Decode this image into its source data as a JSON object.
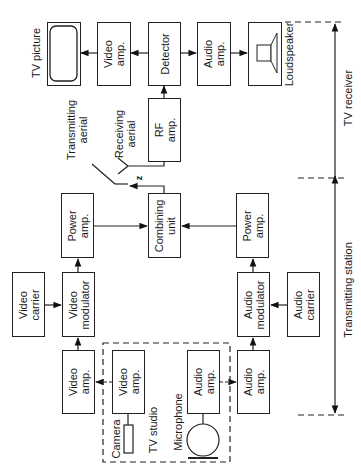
{
  "diagram": {
    "orientation": "rotated-90-ccw",
    "sections": {
      "receiver_label": "TV receiver",
      "transmitter_label": "Transmitting station",
      "studio_label": "TV studio"
    },
    "blocks": {
      "tv_picture": {
        "label": "TV picture"
      },
      "rx_video_amp": {
        "line1": "Video",
        "line2": "amp."
      },
      "detector": {
        "line1": "Detector"
      },
      "rx_audio_amp": {
        "line1": "Audio",
        "line2": "amp."
      },
      "loudspeaker": {
        "label": "Loudspeaker"
      },
      "rf_amp": {
        "line1": "RF",
        "line2": "amp."
      },
      "combining_unit": {
        "line1": "Combining",
        "line2": "unit"
      },
      "video_power_amp": {
        "line1": "Power",
        "line2": "amp."
      },
      "audio_power_amp": {
        "line1": "Power",
        "line2": "amp."
      },
      "video_carrier": {
        "line1": "Video",
        "line2": "carrier"
      },
      "video_modulator": {
        "line1": "Video",
        "line2": "modulator"
      },
      "audio_modulator": {
        "line1": "Audio",
        "line2": "modulator"
      },
      "audio_carrier": {
        "line1": "Audio",
        "line2": "carrier"
      },
      "tx_video_amp": {
        "line1": "Video",
        "line2": "amp."
      },
      "studio_video_amp": {
        "line1": "Video",
        "line2": "amp."
      },
      "studio_audio_amp": {
        "line1": "Audio",
        "line2": "amp."
      },
      "tx_audio_amp": {
        "line1": "Audio",
        "line2": "amp."
      }
    },
    "labels": {
      "camera": "Camera",
      "microphone": "Microphone",
      "transmitting_aerial_1": "Transmitting",
      "transmitting_aerial_2": "aerial",
      "receiving_aerial_1": "Receiving",
      "receiving_aerial_2": "aerial",
      "wave_symbol": "z"
    },
    "connections": [
      [
        "camera",
        "studio_video_amp"
      ],
      [
        "studio_video_amp",
        "tx_video_amp"
      ],
      [
        "tx_video_amp",
        "video_modulator"
      ],
      [
        "video_carrier",
        "video_modulator"
      ],
      [
        "video_modulator",
        "video_power_amp"
      ],
      [
        "video_power_amp",
        "combining_unit"
      ],
      [
        "microphone",
        "studio_audio_amp"
      ],
      [
        "studio_audio_amp",
        "tx_audio_amp"
      ],
      [
        "tx_audio_amp",
        "audio_modulator"
      ],
      [
        "audio_carrier",
        "audio_modulator"
      ],
      [
        "audio_modulator",
        "audio_power_amp"
      ],
      [
        "audio_power_amp",
        "combining_unit"
      ],
      [
        "combining_unit",
        "transmitting_aerial"
      ],
      [
        "receiving_aerial",
        "rf_amp"
      ],
      [
        "rf_amp",
        "detector"
      ],
      [
        "detector",
        "rx_video_amp"
      ],
      [
        "rx_video_amp",
        "tv_picture"
      ],
      [
        "detector",
        "rx_audio_amp"
      ],
      [
        "rx_audio_amp",
        "loudspeaker"
      ]
    ]
  }
}
